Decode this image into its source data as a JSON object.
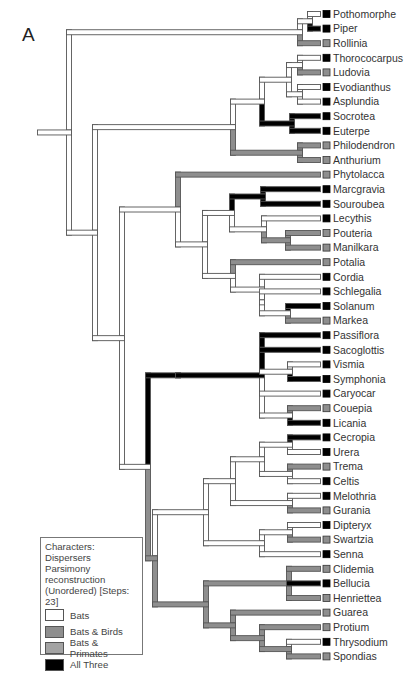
{
  "figure": {
    "panel_label": "A",
    "colors": {
      "bats": "#ffffff",
      "bats_birds": "#8e8e8e",
      "bats_primates": "#a3a3a3",
      "all_three": "#000000",
      "outline": "#555555"
    }
  },
  "legend": {
    "title_lines": [
      "Characters: Dispersers",
      "Parsimony reconstruction",
      "(Unordered) [Steps: 23]"
    ],
    "items": [
      {
        "label": "Bats",
        "state": "bats"
      },
      {
        "label": "Bats & Birds",
        "state": "bats_birds"
      },
      {
        "label": "Bats & Primates",
        "state": "bats_primates"
      },
      {
        "label": "All Three",
        "state": "all_three"
      }
    ]
  },
  "leaves": [
    {
      "name": "Pothomorphe",
      "marker": "all_three",
      "branch": "bats"
    },
    {
      "name": "Piper",
      "marker": "all_three",
      "branch": "all_three"
    },
    {
      "name": "Rollinia",
      "marker": "bats_birds",
      "branch": "bats_birds"
    },
    {
      "name": "Thorococarpus",
      "marker": "all_three",
      "branch": "bats"
    },
    {
      "name": "Ludovia",
      "marker": "bats_birds",
      "branch": "bats_birds"
    },
    {
      "name": "Evodianthus",
      "marker": "all_three",
      "branch": "bats"
    },
    {
      "name": "Asplundia",
      "marker": "all_three",
      "branch": "bats"
    },
    {
      "name": "Socrotea",
      "marker": "all_three",
      "branch": "all_three"
    },
    {
      "name": "Euterpe",
      "marker": "all_three",
      "branch": "all_three"
    },
    {
      "name": "Philodendron",
      "marker": "bats_birds",
      "branch": "bats_birds"
    },
    {
      "name": "Anthurium",
      "marker": "bats_birds",
      "branch": "bats_birds"
    },
    {
      "name": "Phytolacca",
      "marker": "bats_birds",
      "branch": "bats_birds"
    },
    {
      "name": "Marcgravia",
      "marker": "all_three",
      "branch": "all_three"
    },
    {
      "name": "Souroubea",
      "marker": "all_three",
      "branch": "all_three"
    },
    {
      "name": "Lecythis",
      "marker": "all_three",
      "branch": "bats"
    },
    {
      "name": "Pouteria",
      "marker": "bats_birds",
      "branch": "bats_birds"
    },
    {
      "name": "Manilkara",
      "marker": "bats_birds",
      "branch": "bats_birds"
    },
    {
      "name": "Potalia",
      "marker": "bats_birds",
      "branch": "bats_birds"
    },
    {
      "name": "Cordia",
      "marker": "all_three",
      "branch": "bats"
    },
    {
      "name": "Schlegalia",
      "marker": "all_three",
      "branch": "bats"
    },
    {
      "name": "Solanum",
      "marker": "all_three",
      "branch": "all_three"
    },
    {
      "name": "Markea",
      "marker": "bats_birds",
      "branch": "bats_birds"
    },
    {
      "name": "Passiflora",
      "marker": "all_three",
      "branch": "all_three"
    },
    {
      "name": "Sacoglottis",
      "marker": "all_three",
      "branch": "all_three"
    },
    {
      "name": "Vismia",
      "marker": "all_three",
      "branch": "bats"
    },
    {
      "name": "Symphonia",
      "marker": "all_three",
      "branch": "all_three"
    },
    {
      "name": "Caryocar",
      "marker": "all_three",
      "branch": "bats"
    },
    {
      "name": "Couepia",
      "marker": "bats_birds",
      "branch": "bats_birds"
    },
    {
      "name": "Licania",
      "marker": "all_three",
      "branch": "all_three"
    },
    {
      "name": "Cecropia",
      "marker": "all_three",
      "branch": "all_three"
    },
    {
      "name": "Urera",
      "marker": "all_three",
      "branch": "bats"
    },
    {
      "name": "Trema",
      "marker": "bats_birds",
      "branch": "bats_birds"
    },
    {
      "name": "Celtis",
      "marker": "all_three",
      "branch": "bats"
    },
    {
      "name": "Melothria",
      "marker": "all_three",
      "branch": "bats"
    },
    {
      "name": "Gurania",
      "marker": "bats_birds",
      "branch": "bats_birds"
    },
    {
      "name": "Dipteryx",
      "marker": "all_three",
      "branch": "bats"
    },
    {
      "name": "Swartzia",
      "marker": "bats_birds",
      "branch": "bats_birds"
    },
    {
      "name": "Senna",
      "marker": "all_three",
      "branch": "bats"
    },
    {
      "name": "Clidemia",
      "marker": "bats_birds",
      "branch": "bats_birds"
    },
    {
      "name": "Bellucia",
      "marker": "all_three",
      "branch": "all_three"
    },
    {
      "name": "Henriettea",
      "marker": "bats_birds",
      "branch": "bats_birds"
    },
    {
      "name": "Guarea",
      "marker": "bats_birds",
      "branch": "bats_birds"
    },
    {
      "name": "Protium",
      "marker": "bats_birds",
      "branch": "bats_birds"
    },
    {
      "name": "Thrysodium",
      "marker": "all_three",
      "branch": "bats"
    },
    {
      "name": "Spondias",
      "marker": "bats_birds",
      "branch": "bats_birds"
    }
  ],
  "tree": {
    "x": 69,
    "state": "bats",
    "stem_x": 40,
    "children": [
      {
        "x": 300,
        "state": "bats",
        "children": [
          {
            "x": 310,
            "state": "bats",
            "children": [
              {
                "leaf": 0
              },
              {
                "leaf": 1
              }
            ]
          },
          {
            "leaf": 2
          }
        ]
      },
      {
        "x": 95,
        "state": "bats",
        "children": [
          {
            "x": 233,
            "state": "bats",
            "children": [
              {
                "x": 262,
                "state": "bats",
                "children": [
                  {
                    "x": 289,
                    "state": "bats",
                    "children": [
                      {
                        "x": 300,
                        "state": "bats",
                        "children": [
                          {
                            "leaf": 3
                          },
                          {
                            "leaf": 4
                          }
                        ]
                      },
                      {
                        "x": 300,
                        "state": "bats",
                        "children": [
                          {
                            "leaf": 5
                          },
                          {
                            "leaf": 6
                          }
                        ]
                      }
                    ]
                  },
                  {
                    "x": 292,
                    "state": "all_three",
                    "children": [
                      {
                        "leaf": 7
                      },
                      {
                        "leaf": 8
                      }
                    ]
                  }
                ]
              },
              {
                "x": 300,
                "state": "bats_birds",
                "children": [
                  {
                    "leaf": 9
                  },
                  {
                    "leaf": 10
                  }
                ]
              }
            ]
          },
          {
            "x": 122,
            "state": "bats",
            "children": [
              {
                "x": 178,
                "state": "bats",
                "children": [
                  {
                    "leaf": 11
                  },
                  {
                    "x": 205,
                    "state": "bats",
                    "children": [
                      {
                        "x": 232,
                        "state": "bats",
                        "children": [
                          {
                            "x": 263,
                            "state": "all_three",
                            "children": [
                              {
                                "leaf": 12
                              },
                              {
                                "leaf": 13
                              }
                            ]
                          },
                          {
                            "x": 264,
                            "state": "bats",
                            "children": [
                              {
                                "leaf": 14
                              },
                              {
                                "x": 288,
                                "state": "bats_birds",
                                "children": [
                                  {
                                    "leaf": 15
                                  },
                                  {
                                    "leaf": 16
                                  }
                                ]
                              }
                            ]
                          }
                        ]
                      },
                      {
                        "x": 233,
                        "state": "bats",
                        "children": [
                          {
                            "leaf": 17
                          },
                          {
                            "x": 262,
                            "state": "bats",
                            "children": [
                              {
                                "leaf": 18
                              },
                              {
                                "x": 262,
                                "state": "bats",
                                "children": [
                                  {
                                    "leaf": 19
                                  },
                                  {
                                    "x": 288,
                                    "state": "bats",
                                    "children": [
                                      {
                                        "leaf": 20
                                      },
                                      {
                                        "leaf": 21
                                      }
                                    ]
                                  }
                                ]
                              }
                            ]
                          }
                        ]
                      }
                    ]
                  }
                ]
              },
              {
                "x": 148,
                "state": "bats",
                "children": [
                  {
                    "x": 178,
                    "state": "all_three",
                    "children": [
                      {
                        "x": 262,
                        "state": "all_three",
                        "children": [
                          {
                            "leaf": 22
                          },
                          {
                            "leaf": 23
                          },
                          {
                            "x": 290,
                            "state": "bats",
                            "children": [
                              {
                                "leaf": 24
                              },
                              {
                                "leaf": 25
                              }
                            ]
                          },
                          {
                            "leaf": 26
                          },
                          {
                            "x": 290,
                            "state": "bats",
                            "children": [
                              {
                                "leaf": 27
                              },
                              {
                                "leaf": 28
                              }
                            ]
                          }
                        ]
                      }
                    ]
                  },
                  {
                    "x": 155,
                    "state": "bats_birds",
                    "children": [
                      {
                        "x": 206,
                        "state": "bats",
                        "children": [
                          {
                            "x": 233,
                            "state": "bats",
                            "children": [
                              {
                                "x": 262,
                                "state": "bats",
                                "children": [
                                  {
                                    "x": 290,
                                    "state": "bats",
                                    "children": [
                                      {
                                        "leaf": 29
                                      },
                                      {
                                        "leaf": 30
                                      }
                                    ]
                                  },
                                  {
                                    "x": 290,
                                    "state": "bats",
                                    "children": [
                                      {
                                        "leaf": 31
                                      },
                                      {
                                        "leaf": 32
                                      }
                                    ]
                                  }
                                ]
                              },
                              {
                                "x": 290,
                                "state": "bats",
                                "children": [
                                  {
                                    "leaf": 33
                                  },
                                  {
                                    "leaf": 34
                                  }
                                ]
                              }
                            ]
                          },
                          {
                            "x": 262,
                            "state": "bats",
                            "children": [
                              {
                                "x": 290,
                                "state": "bats",
                                "children": [
                                  {
                                    "leaf": 35
                                  },
                                  {
                                    "leaf": 36
                                  }
                                ]
                              },
                              {
                                "leaf": 37
                              }
                            ]
                          }
                        ]
                      },
                      {
                        "x": 206,
                        "state": "bats_birds",
                        "children": [
                          {
                            "x": 289,
                            "state": "bats_birds",
                            "children": [
                              {
                                "leaf": 38
                              },
                              {
                                "leaf": 39
                              },
                              {
                                "leaf": 40
                              }
                            ]
                          },
                          {
                            "x": 233,
                            "state": "bats_birds",
                            "children": [
                              {
                                "leaf": 41
                              },
                              {
                                "x": 262,
                                "state": "bats_birds",
                                "children": [
                                  {
                                    "leaf": 42
                                  },
                                  {
                                    "x": 289,
                                    "state": "bats_birds",
                                    "children": [
                                      {
                                        "leaf": 43
                                      },
                                      {
                                        "leaf": 44
                                      }
                                    ]
                                  }
                                ]
                              }
                            ]
                          }
                        ]
                      }
                    ]
                  }
                ]
              }
            ]
          }
        ]
      }
    ]
  },
  "layout": {
    "leaf_y0": 14,
    "leaf_dy": 14.6,
    "tip_x": 318,
    "branch_w": 5
  }
}
